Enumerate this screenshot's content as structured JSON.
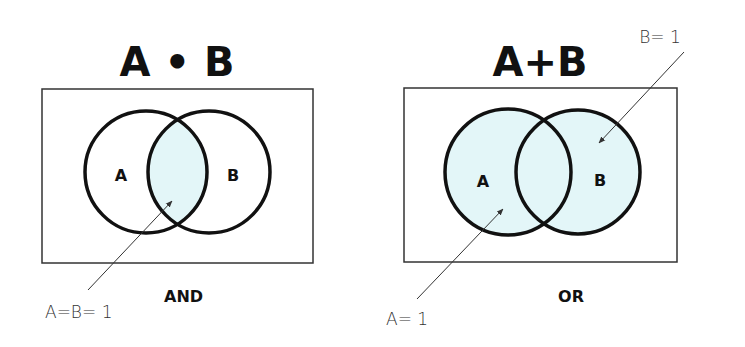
{
  "colors": {
    "shade": "#e3f6f8",
    "stroke": "#111111",
    "frame": "#333333",
    "background": "#ffffff"
  },
  "and_panel": {
    "title": "A • B",
    "set_a_label": "A",
    "set_b_label": "B",
    "operation_label": "AND",
    "annotation": "A=B= 1",
    "shaded_region": "intersection"
  },
  "or_panel": {
    "title": "A+B",
    "set_a_label": "A",
    "set_b_label": "B",
    "operation_label": "OR",
    "annotation_a": "A= 1",
    "annotation_b": "B= 1",
    "shaded_region": "union"
  }
}
